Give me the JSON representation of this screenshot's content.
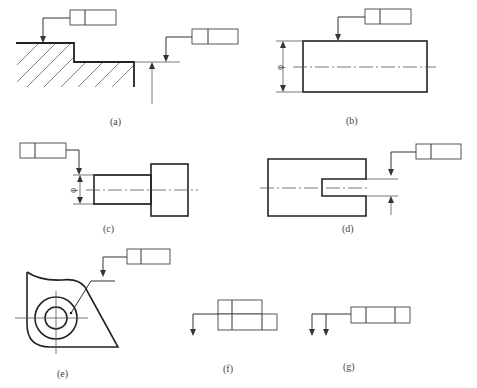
{
  "figure": {
    "top_cutoff_text": "",
    "panels": [
      {
        "id": "a",
        "caption": "(a)",
        "description": "Tolerance frame leader to stepped surface with hatching, and leader to extension line"
      },
      {
        "id": "b",
        "caption": "(b)",
        "description": "Tolerance frame leader to top surface of rectangle with diameter dimension"
      },
      {
        "id": "c",
        "caption": "(c)",
        "description": "Tolerance frame leader aligned with diameter dimension line on stepped shaft"
      },
      {
        "id": "d",
        "caption": "(d)",
        "description": "Tolerance frame leader aligned with slot width dimension"
      },
      {
        "id": "e",
        "caption": "(e)",
        "description": "Tolerance frame leader to reference line with dot on surface"
      },
      {
        "id": "f",
        "caption": "(f)",
        "description": "Stacked tolerance frames with single leader"
      },
      {
        "id": "g",
        "caption": "(g)",
        "description": "Three-cell tolerance frame with two leader arrows"
      }
    ],
    "symbols": {
      "diameter": "φ"
    }
  }
}
